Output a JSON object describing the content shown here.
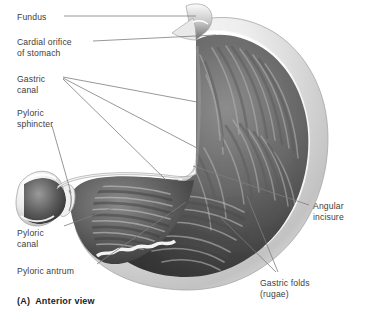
{
  "figure": {
    "caption": "(A)  Anterior view",
    "background_color": "#ffffff",
    "label_color": "#3d3d3d",
    "leader_line_color": "#7a7a7a",
    "wall_outline_color": "#9a9a9a",
    "serosa_light": "#f2f2f2",
    "mucosa_dark": "#2e2e2e",
    "mucosa_mid": "#6f6f6f",
    "mucosa_light": "#c9c9c9"
  },
  "labels": [
    {
      "id": "fundus",
      "text": "Fundus",
      "x": 17,
      "y": 12
    },
    {
      "id": "cardial-orifice",
      "text": "Cardial orifice",
      "x": 17,
      "y": 37
    },
    {
      "id": "cardial-orifice-2",
      "text": "of stomach",
      "x": 17,
      "y": 48
    },
    {
      "id": "gastric-canal",
      "text": "Gastric",
      "x": 17,
      "y": 74
    },
    {
      "id": "gastric-canal-2",
      "text": "canal",
      "x": 17,
      "y": 85
    },
    {
      "id": "pyloric-sphincter",
      "text": "Pyloric",
      "x": 17,
      "y": 108
    },
    {
      "id": "pyloric-sphincter-2",
      "text": "sphincter",
      "x": 17,
      "y": 119
    },
    {
      "id": "pyloric-canal",
      "text": "Pyloric",
      "x": 17,
      "y": 228
    },
    {
      "id": "pyloric-canal-2",
      "text": "canal",
      "x": 17,
      "y": 239
    },
    {
      "id": "pyloric-antrum",
      "text": "Pyloric antrum",
      "x": 17,
      "y": 266
    },
    {
      "id": "angular-incisure",
      "text": "Angular",
      "x": 313,
      "y": 201
    },
    {
      "id": "angular-incisure-2",
      "text": "incisure",
      "x": 313,
      "y": 212
    },
    {
      "id": "gastric-folds",
      "text": "Gastric folds",
      "x": 260,
      "y": 278
    },
    {
      "id": "gastric-folds-2",
      "text": "(rugae)",
      "x": 260,
      "y": 289
    }
  ],
  "leader_lines": [
    {
      "id": "leader-fundus",
      "from": [
        64,
        16
      ],
      "to": [
        196,
        16
      ]
    },
    {
      "id": "leader-cardial-orifice",
      "from": [
        93,
        41
      ],
      "to": [
        216,
        35
      ]
    },
    {
      "id": "leader-gastric-canal-a",
      "from": [
        63,
        77
      ],
      "to": [
        197,
        102
      ]
    },
    {
      "id": "leader-gastric-canal-b",
      "from": [
        63,
        78
      ],
      "to": [
        197,
        148
      ]
    },
    {
      "id": "leader-gastric-canal-c",
      "from": [
        63,
        79
      ],
      "to": [
        166,
        180
      ]
    },
    {
      "id": "leader-pyloric-sphincter",
      "from": [
        52,
        126
      ],
      "to": [
        71,
        193
      ]
    },
    {
      "id": "leader-pyloric-canal",
      "from": [
        64,
        226
      ],
      "to": [
        113,
        208
      ]
    },
    {
      "id": "leader-pyloric-antrum",
      "from": [
        97,
        264
      ],
      "to": [
        186,
        202
      ]
    },
    {
      "id": "leader-angular-incisure",
      "from": [
        309,
        205
      ],
      "to": [
        193,
        166
      ]
    },
    {
      "id": "leader-gastric-folds-a",
      "from": [
        276,
        272
      ],
      "to": [
        219,
        216
      ]
    },
    {
      "id": "leader-gastric-folds-b",
      "from": [
        278,
        272
      ],
      "to": [
        247,
        196
      ]
    }
  ],
  "anatomy_parts": [
    "esophagus-stub",
    "cardial-notch",
    "fundus-dome",
    "gastric-body",
    "greater-curvature",
    "lesser-curvature",
    "angular-incisure-notch",
    "pyloric-antrum-region",
    "pyloric-canal-region",
    "pyloric-sphincter-ring",
    "duodenal-bulb",
    "gastric-rugae-folds"
  ]
}
